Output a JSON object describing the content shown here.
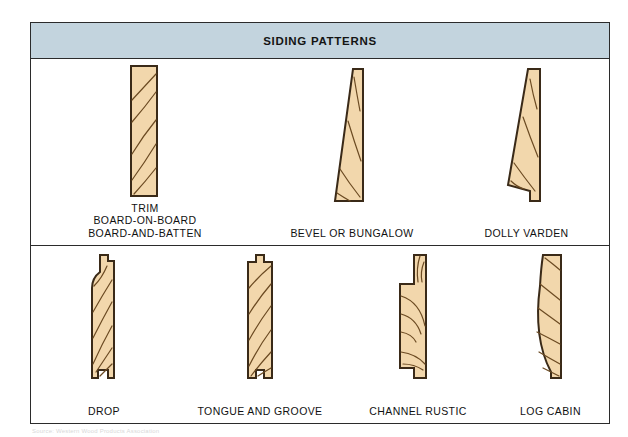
{
  "figure": {
    "title": "SIDING PATTERNS",
    "colors": {
      "title_band": "#C3D4DE",
      "frame_border": "#2B2B2B",
      "wood_fill": "#F2D7AC",
      "wood_outline": "#3A2A18",
      "grain_line": "#6B4A22",
      "page_background": "#FFFFFF"
    },
    "credit": "Source: Western Wood Products Association"
  },
  "rows": [
    {
      "name": "top-row",
      "items": [
        {
          "id": "trim",
          "shape": "rectangular-board",
          "caption_lines": [
            "TRIM",
            "BOARD-ON-BOARD",
            "BOARD-AND-BATTEN"
          ]
        },
        {
          "id": "bevel",
          "shape": "tapered-wedge",
          "caption_lines": [
            "BEVEL OR BUNGALOW"
          ]
        },
        {
          "id": "dolly-varden",
          "shape": "tapered-wedge-with-rabbet",
          "caption_lines": [
            "DOLLY VARDEN"
          ]
        }
      ]
    },
    {
      "name": "bottom-row",
      "items": [
        {
          "id": "drop",
          "shape": "drop-profile-tongue-and-groove",
          "caption_lines": [
            "DROP"
          ]
        },
        {
          "id": "tongue-and-groove",
          "shape": "tongue-and-groove-profile",
          "caption_lines": [
            "TONGUE AND GROOVE"
          ]
        },
        {
          "id": "channel-rustic",
          "shape": "channel-rustic-profile",
          "caption_lines": [
            "CHANNEL RUSTIC"
          ]
        },
        {
          "id": "log-cabin",
          "shape": "log-cabin-convex-profile",
          "caption_lines": [
            "LOG CABIN"
          ]
        }
      ]
    }
  ]
}
